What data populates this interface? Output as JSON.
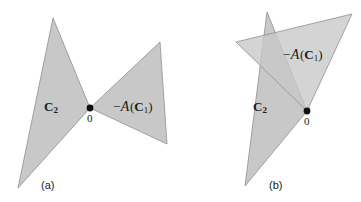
{
  "figure": {
    "title": "",
    "background_color": "#ffffff",
    "cone_fill_color": "#c8c8c8",
    "cone_overlap_color": "#9f9f9f",
    "cone_stroke_color": "#8f8f8f",
    "origin_dot_color": "#111111",
    "panels": [
      {
        "id": "a",
        "caption": "(a)",
        "origin_label": "0",
        "labels": {
          "c2": "C",
          "c2_sub": "2",
          "neg_a_minus": "−",
          "neg_a_script": "A",
          "neg_a_open": "(",
          "neg_a_c": "C",
          "neg_a_sub": "1",
          "neg_a_close": ")",
          "neg_a_full": "−A(C₁)"
        }
      },
      {
        "id": "b",
        "caption": "(b)",
        "origin_label": "0",
        "labels": {
          "c2": "C",
          "c2_sub": "2",
          "neg_a_minus": "−",
          "neg_a_script": "A",
          "neg_a_open": "(",
          "neg_a_c": "C",
          "neg_a_sub": "1",
          "neg_a_close": ")",
          "neg_a_full": "−A(C₁)"
        }
      }
    ]
  },
  "chart_data": {
    "type": "diagram",
    "panels": [
      {
        "id": "a",
        "caption": "(a)",
        "description": "Cones C2 and -A(C1) intersect only at the origin",
        "origin": [
          90,
          108
        ],
        "shapes": [
          {
            "name": "C2",
            "label": "C2",
            "points": [
              [
                90,
                108
              ],
              [
                53,
                18
              ],
              [
                18,
                188
              ]
            ],
            "fill": "#c8c8c8"
          },
          {
            "name": "neg-A-C1",
            "label": "-A(C1)",
            "points": [
              [
                90,
                108
              ],
              [
                160,
                42
              ],
              [
                167,
                144
              ]
            ],
            "fill": "#c8c8c8"
          }
        ]
      },
      {
        "id": "b",
        "caption": "(b)",
        "description": "Cones C2 and -A(C1) overlap in a darker wedge region",
        "origin": [
          307,
          111
        ],
        "shapes": [
          {
            "name": "C2",
            "label": "C2",
            "points": [
              [
                307,
                111
              ],
              [
                267,
                12
              ],
              [
                245,
                186
              ]
            ],
            "fill": "#c8c8c8"
          },
          {
            "name": "neg-A-C1",
            "label": "-A(C1)",
            "points": [
              [
                307,
                111
              ],
              [
                236,
                42
              ],
              [
                352,
                14
              ]
            ],
            "fill": "#c8c8c8"
          }
        ]
      }
    ]
  }
}
